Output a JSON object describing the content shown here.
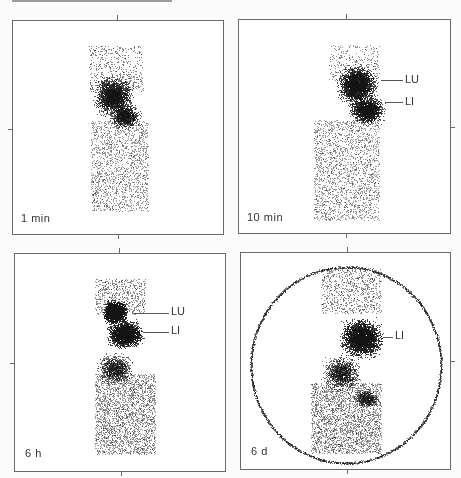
{
  "figure": {
    "panels": [
      {
        "id": "p1",
        "time_label": "1 min",
        "annotations": [],
        "frame": [
          12,
          20,
          212,
          215
        ]
      },
      {
        "id": "p2",
        "time_label": "10 min",
        "annotations": [
          {
            "text": "LU",
            "y": 79
          },
          {
            "text": "LI",
            "y": 101
          }
        ],
        "frame": [
          238,
          19,
          213,
          215
        ]
      },
      {
        "id": "p3",
        "time_label": "6 h",
        "annotations": [
          {
            "text": "LU",
            "y": 313
          },
          {
            "text": "LI",
            "y": 331
          }
        ],
        "frame": [
          14,
          253,
          212,
          219
        ]
      },
      {
        "id": "p4",
        "time_label": "6 d",
        "annotations": [
          {
            "text": "LI",
            "y": 336
          }
        ],
        "frame": [
          240,
          252,
          211,
          218
        ]
      }
    ],
    "colors": {
      "frame": "#6a6a6a",
      "dots": "#1a1a1a",
      "background": "#ffffff"
    }
  }
}
